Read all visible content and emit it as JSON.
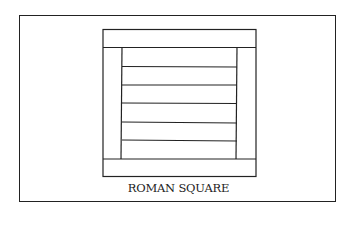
{
  "diagram": {
    "caption": "ROMAN SQUARE",
    "line_color": "#222222",
    "background": "#ffffff",
    "block": {
      "top_band": true,
      "bottom_band": true,
      "side_columns": 2,
      "center_strips": 6
    }
  }
}
